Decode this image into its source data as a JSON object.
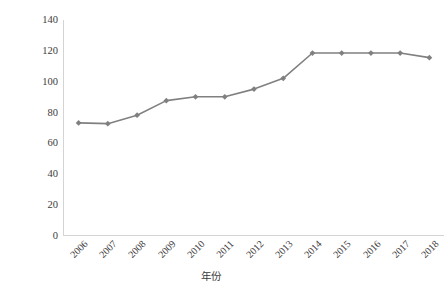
{
  "chart_data": {
    "type": "line",
    "title": "",
    "xlabel": "年份",
    "ylabel": "价格：元/50KG",
    "categories": [
      "2006",
      "2007",
      "2008",
      "2009",
      "2010",
      "2011",
      "2012",
      "2013",
      "2014",
      "2015",
      "2016",
      "2017",
      "2018"
    ],
    "values": [
      73,
      72.5,
      78,
      87.5,
      90,
      90,
      95,
      102,
      118.5,
      118.5,
      118.5,
      118.5,
      115.5
    ],
    "series": [
      {
        "name": "价格",
        "values": [
          73,
          72.5,
          78,
          87.5,
          90,
          90,
          95,
          102,
          118.5,
          118.5,
          118.5,
          118.5,
          115.5
        ]
      }
    ],
    "ylim": [
      0,
      140
    ],
    "y_ticks": [
      0,
      20,
      40,
      60,
      80,
      100,
      120,
      140
    ],
    "y_tick_labels": [
      "0",
      "20",
      "40",
      "60",
      "80",
      "100",
      "120",
      "140"
    ],
    "grid": false,
    "legend": "none",
    "marker": "diamond",
    "line_color": "#808080",
    "marker_color": "#808080",
    "axis_color": "#d4d4d4",
    "text_color": "#3b3b3b",
    "background": "#ffffff"
  }
}
